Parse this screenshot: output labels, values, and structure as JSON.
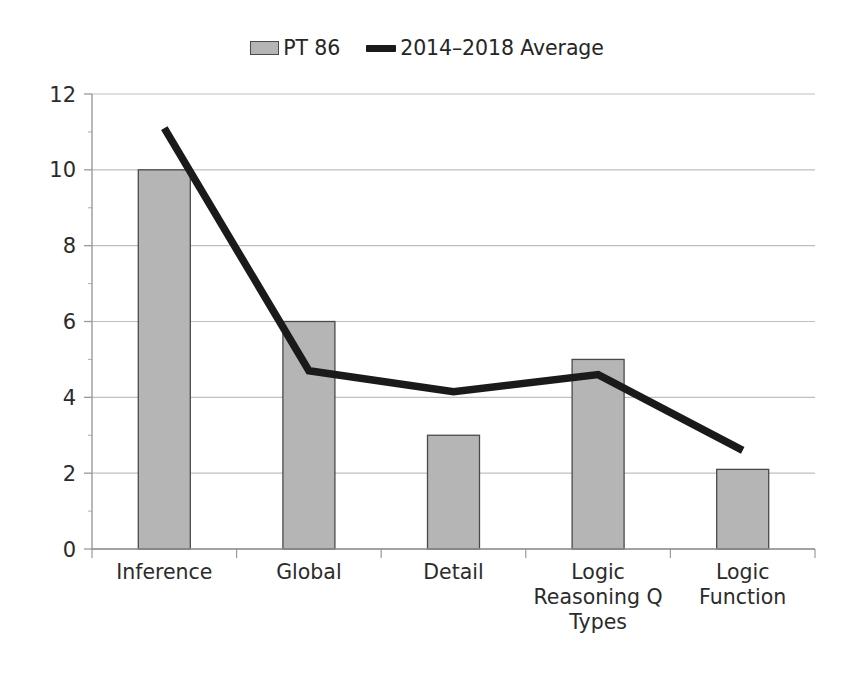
{
  "legend": {
    "entries": [
      {
        "label": "PT 86",
        "marker": "bar-swatch",
        "color": "#b5b5b5"
      },
      {
        "label": "2014–2018 Average",
        "marker": "line-swatch",
        "color": "#1a1a1a"
      }
    ]
  },
  "axes": {
    "y_ticks": [
      "12",
      "10",
      "8",
      "6",
      "4",
      "2",
      "0"
    ],
    "x_labels": [
      [
        "Inference"
      ],
      [
        "Global"
      ],
      [
        "Detail"
      ],
      [
        "Logic",
        "Reasoning Q",
        "Types"
      ],
      [
        "Logic",
        "Function"
      ]
    ]
  },
  "chart_data": {
    "type": "bar",
    "title": "",
    "xlabel": "",
    "ylabel": "",
    "categories": [
      "Inference",
      "Global",
      "Detail",
      "Logic Reasoning Q Types",
      "Logic Function"
    ],
    "series": [
      {
        "name": "PT 86",
        "type": "bar",
        "color": "#b5b5b5",
        "border_color": "#4a4a4a",
        "values": [
          10,
          6,
          3,
          5,
          2.1
        ]
      },
      {
        "name": "2014–2018 Average",
        "type": "line",
        "color": "#1a1a1a",
        "values": [
          11.1,
          4.7,
          4.15,
          4.6,
          2.6
        ]
      }
    ],
    "ylim": [
      0,
      12
    ],
    "ytick_step": 2,
    "minor_ytick_step": 1,
    "grid": true,
    "legend_position": "top-center"
  }
}
